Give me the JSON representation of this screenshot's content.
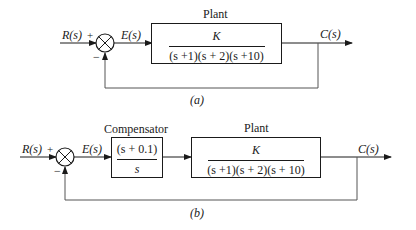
{
  "diagram_a": {
    "caption": "(a)",
    "input_label": "R(s)",
    "plus_sign": "+",
    "minus_sign": "−",
    "error_label": "E(s)",
    "output_label": "C(s)",
    "plant": {
      "title": "Plant",
      "numerator": "K",
      "denominator": "(s +1)(s + 2)(s +10)"
    }
  },
  "diagram_b": {
    "caption": "(b)",
    "input_label": "R(s)",
    "plus_sign": "+",
    "minus_sign": "−",
    "error_label": "E(s)",
    "output_label": "C(s)",
    "compensator": {
      "title": "Compensator",
      "numerator": "(s + 0.1)",
      "denominator": "s"
    },
    "plant": {
      "title": "Plant",
      "numerator": "K",
      "denominator": "(s +1)(s + 2)(s + 10)"
    }
  },
  "colors": {
    "line": "#1a1a1a",
    "feedback_line": "#555555",
    "background": "#ffffff"
  }
}
